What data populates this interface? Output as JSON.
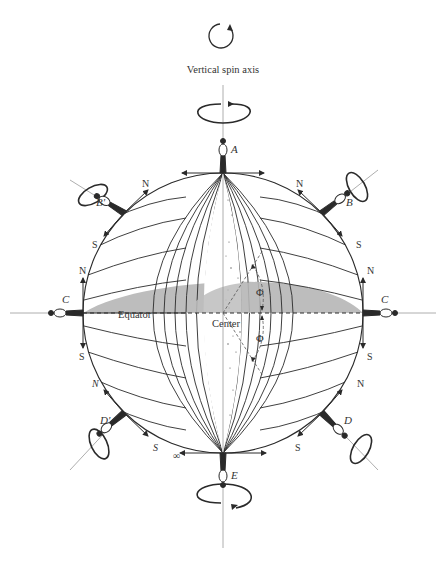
{
  "diagram": {
    "caption": "Vertical spin axis",
    "positions": {
      "top": "A",
      "upper_left": "B'",
      "upper_right": "B",
      "left": "C",
      "right": "C",
      "lower_left": "D'",
      "lower_right": "D",
      "bottom": "E"
    },
    "labels": {
      "equator": "Equator",
      "center": "Center",
      "angle_upper": "Φ",
      "angle_lower": "Φ",
      "infinity": "∞",
      "north": "N",
      "south": "S"
    },
    "icons": {
      "spin_legend": "rotation-arrow-icon",
      "gyroscope": "gyroscope-icon"
    },
    "colors": {
      "line": "#2a2a2a",
      "equatorial_plane": "#bdbdbd",
      "stipple": "#555555",
      "background": "#ffffff"
    }
  }
}
